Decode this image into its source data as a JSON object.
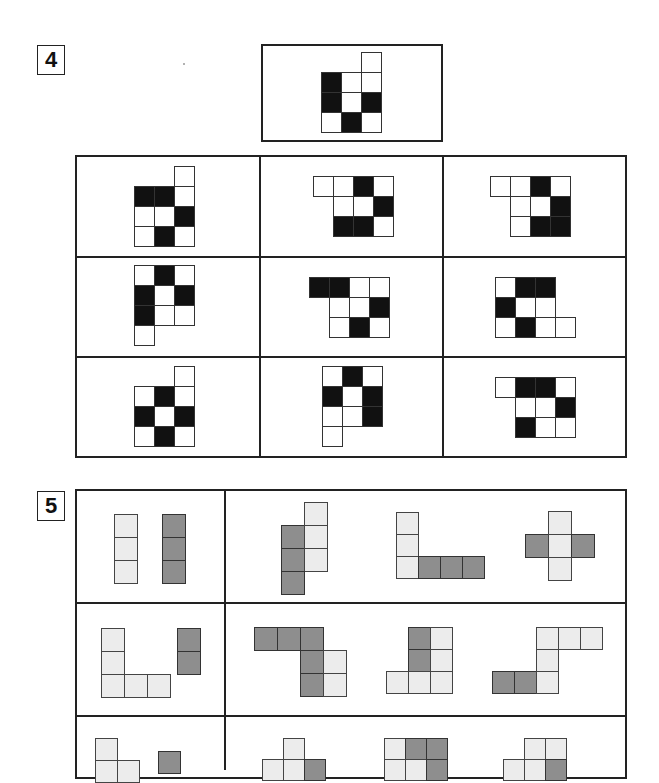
{
  "section4": {
    "label": "4",
    "reference": {
      "x": 321,
      "y": 52,
      "size": 20,
      "cells": [
        [
          2,
          0,
          "w"
        ],
        [
          0,
          1,
          "b"
        ],
        [
          1,
          1,
          "w"
        ],
        [
          2,
          1,
          "w"
        ],
        [
          0,
          2,
          "b"
        ],
        [
          1,
          2,
          "w"
        ],
        [
          2,
          2,
          "b"
        ],
        [
          0,
          3,
          "w"
        ],
        [
          1,
          3,
          "b"
        ],
        [
          2,
          3,
          "w"
        ]
      ]
    },
    "options": [
      {
        "x": 134,
        "y": 166,
        "size": 20,
        "cells": [
          [
            2,
            0,
            "w"
          ],
          [
            0,
            1,
            "b"
          ],
          [
            1,
            1,
            "b"
          ],
          [
            2,
            1,
            "w"
          ],
          [
            0,
            2,
            "w"
          ],
          [
            1,
            2,
            "w"
          ],
          [
            2,
            2,
            "b"
          ],
          [
            0,
            3,
            "w"
          ],
          [
            1,
            3,
            "b"
          ],
          [
            2,
            3,
            "w"
          ]
        ]
      },
      {
        "x": 313,
        "y": 176,
        "size": 20,
        "cells": [
          [
            0,
            0,
            "w"
          ],
          [
            1,
            0,
            "w"
          ],
          [
            2,
            0,
            "b"
          ],
          [
            3,
            0,
            "w"
          ],
          [
            1,
            1,
            "w"
          ],
          [
            2,
            1,
            "w"
          ],
          [
            3,
            1,
            "b"
          ],
          [
            1,
            2,
            "b"
          ],
          [
            2,
            2,
            "b"
          ],
          [
            3,
            2,
            "w"
          ]
        ]
      },
      {
        "x": 490,
        "y": 176,
        "size": 20,
        "cells": [
          [
            0,
            0,
            "w"
          ],
          [
            1,
            0,
            "w"
          ],
          [
            2,
            0,
            "b"
          ],
          [
            3,
            0,
            "w"
          ],
          [
            1,
            1,
            "w"
          ],
          [
            2,
            1,
            "w"
          ],
          [
            3,
            1,
            "b"
          ],
          [
            1,
            2,
            "w"
          ],
          [
            2,
            2,
            "b"
          ],
          [
            3,
            2,
            "b"
          ]
        ]
      },
      {
        "x": 134,
        "y": 265,
        "size": 20,
        "cells": [
          [
            0,
            0,
            "w"
          ],
          [
            1,
            0,
            "b"
          ],
          [
            2,
            0,
            "w"
          ],
          [
            0,
            1,
            "b"
          ],
          [
            1,
            1,
            "w"
          ],
          [
            2,
            1,
            "b"
          ],
          [
            0,
            2,
            "b"
          ],
          [
            1,
            2,
            "w"
          ],
          [
            2,
            2,
            "w"
          ],
          [
            0,
            3,
            "w"
          ]
        ]
      },
      {
        "x": 309,
        "y": 277,
        "size": 20,
        "cells": [
          [
            0,
            0,
            "b"
          ],
          [
            1,
            0,
            "b"
          ],
          [
            2,
            0,
            "w"
          ],
          [
            3,
            0,
            "w"
          ],
          [
            1,
            1,
            "w"
          ],
          [
            2,
            1,
            "w"
          ],
          [
            3,
            1,
            "b"
          ],
          [
            1,
            2,
            "w"
          ],
          [
            2,
            2,
            "b"
          ],
          [
            3,
            2,
            "w"
          ]
        ]
      },
      {
        "x": 495,
        "y": 277,
        "size": 20,
        "cells": [
          [
            0,
            0,
            "w"
          ],
          [
            1,
            0,
            "b"
          ],
          [
            2,
            0,
            "b"
          ],
          [
            0,
            1,
            "b"
          ],
          [
            1,
            1,
            "w"
          ],
          [
            2,
            1,
            "w"
          ],
          [
            0,
            2,
            "w"
          ],
          [
            1,
            2,
            "b"
          ],
          [
            2,
            2,
            "w"
          ],
          [
            3,
            2,
            "w"
          ]
        ]
      },
      {
        "x": 134,
        "y": 366,
        "size": 20,
        "cells": [
          [
            2,
            0,
            "w"
          ],
          [
            0,
            1,
            "w"
          ],
          [
            1,
            1,
            "b"
          ],
          [
            2,
            1,
            "w"
          ],
          [
            0,
            2,
            "b"
          ],
          [
            1,
            2,
            "w"
          ],
          [
            2,
            2,
            "b"
          ],
          [
            0,
            3,
            "w"
          ],
          [
            1,
            3,
            "b"
          ],
          [
            2,
            3,
            "w"
          ]
        ]
      },
      {
        "x": 322,
        "y": 366,
        "size": 20,
        "cells": [
          [
            0,
            0,
            "w"
          ],
          [
            1,
            0,
            "b"
          ],
          [
            2,
            0,
            "w"
          ],
          [
            0,
            1,
            "b"
          ],
          [
            1,
            1,
            "w"
          ],
          [
            2,
            1,
            "b"
          ],
          [
            0,
            2,
            "w"
          ],
          [
            1,
            2,
            "w"
          ],
          [
            2,
            2,
            "b"
          ],
          [
            0,
            3,
            "w"
          ]
        ]
      },
      {
        "x": 495,
        "y": 377,
        "size": 20,
        "cells": [
          [
            0,
            0,
            "w"
          ],
          [
            1,
            0,
            "b"
          ],
          [
            2,
            0,
            "b"
          ],
          [
            3,
            0,
            "w"
          ],
          [
            1,
            1,
            "w"
          ],
          [
            2,
            1,
            "w"
          ],
          [
            3,
            1,
            "b"
          ],
          [
            1,
            2,
            "b"
          ],
          [
            2,
            2,
            "w"
          ],
          [
            3,
            2,
            "w"
          ]
        ]
      }
    ]
  },
  "section5": {
    "label": "5",
    "rows": [
      {
        "left": [
          {
            "x": 114,
            "y": 514,
            "size": 23,
            "cells": [
              [
                0,
                0,
                "l"
              ],
              [
                0,
                1,
                "l"
              ],
              [
                0,
                2,
                "l"
              ]
            ]
          },
          {
            "x": 162,
            "y": 514,
            "size": 23,
            "cells": [
              [
                0,
                0,
                "g"
              ],
              [
                0,
                1,
                "g"
              ],
              [
                0,
                2,
                "g"
              ]
            ]
          }
        ],
        "right": [
          {
            "x": 281,
            "y": 502,
            "size": 23,
            "cells": [
              [
                1,
                0,
                "l"
              ],
              [
                0,
                1,
                "g"
              ],
              [
                1,
                1,
                "l"
              ],
              [
                0,
                2,
                "g"
              ],
              [
                1,
                2,
                "l"
              ],
              [
                0,
                3,
                "g"
              ]
            ]
          },
          {
            "x": 396,
            "y": 512,
            "size": 22,
            "cells": [
              [
                0,
                0,
                "l"
              ],
              [
                0,
                1,
                "l"
              ],
              [
                0,
                2,
                "l"
              ],
              [
                1,
                2,
                "g"
              ],
              [
                2,
                2,
                "g"
              ],
              [
                3,
                2,
                "g"
              ]
            ]
          },
          {
            "x": 525,
            "y": 511,
            "size": 23,
            "cells": [
              [
                1,
                0,
                "l"
              ],
              [
                0,
                1,
                "g"
              ],
              [
                1,
                1,
                "l"
              ],
              [
                2,
                1,
                "g"
              ],
              [
                1,
                2,
                "l"
              ]
            ]
          }
        ]
      },
      {
        "left": [
          {
            "x": 101,
            "y": 628,
            "size": 23,
            "cells": [
              [
                0,
                0,
                "l"
              ],
              [
                0,
                1,
                "l"
              ],
              [
                0,
                2,
                "l"
              ],
              [
                1,
                2,
                "l"
              ],
              [
                2,
                2,
                "l"
              ]
            ]
          },
          {
            "x": 177,
            "y": 628,
            "size": 23,
            "cells": [
              [
                0,
                0,
                "g"
              ],
              [
                0,
                1,
                "g"
              ]
            ]
          }
        ],
        "right": [
          {
            "x": 254,
            "y": 627,
            "size": 23,
            "cells": [
              [
                0,
                0,
                "g"
              ],
              [
                1,
                0,
                "g"
              ],
              [
                2,
                0,
                "g"
              ],
              [
                2,
                1,
                "g"
              ],
              [
                3,
                1,
                "l"
              ],
              [
                2,
                2,
                "g"
              ],
              [
                3,
                2,
                "l"
              ]
            ]
          },
          {
            "x": 386,
            "y": 627,
            "size": 22,
            "cells": [
              [
                1,
                0,
                "g"
              ],
              [
                2,
                0,
                "l"
              ],
              [
                1,
                1,
                "g"
              ],
              [
                2,
                1,
                "l"
              ],
              [
                0,
                2,
                "l"
              ],
              [
                1,
                2,
                "l"
              ],
              [
                2,
                2,
                "l"
              ]
            ]
          },
          {
            "x": 492,
            "y": 627,
            "size": 22,
            "cells": [
              [
                2,
                0,
                "l"
              ],
              [
                3,
                0,
                "l"
              ],
              [
                4,
                0,
                "l"
              ],
              [
                2,
                1,
                "l"
              ],
              [
                0,
                2,
                "g"
              ],
              [
                1,
                2,
                "g"
              ],
              [
                2,
                2,
                "l"
              ]
            ]
          }
        ]
      },
      {
        "left": [
          {
            "x": 95,
            "y": 738,
            "size": 22,
            "cells": [
              [
                0,
                0,
                "l"
              ],
              [
                0,
                1,
                "l"
              ],
              [
                1,
                1,
                "l"
              ]
            ]
          },
          {
            "x": 158,
            "y": 751,
            "size": 22,
            "cells": [
              [
                0,
                0,
                "g"
              ]
            ]
          }
        ],
        "right": [
          {
            "x": 262,
            "y": 738,
            "size": 21,
            "cells": [
              [
                1,
                0,
                "l"
              ],
              [
                0,
                1,
                "l"
              ],
              [
                1,
                1,
                "l"
              ],
              [
                2,
                1,
                "g"
              ]
            ]
          },
          {
            "x": 384,
            "y": 738,
            "size": 21,
            "cells": [
              [
                0,
                0,
                "l"
              ],
              [
                1,
                0,
                "g"
              ],
              [
                2,
                0,
                "g"
              ],
              [
                0,
                1,
                "l"
              ],
              [
                1,
                1,
                "l"
              ],
              [
                2,
                1,
                "g"
              ]
            ]
          },
          {
            "x": 503,
            "y": 738,
            "size": 21,
            "cells": [
              [
                1,
                0,
                "l"
              ],
              [
                2,
                0,
                "l"
              ],
              [
                0,
                1,
                "l"
              ],
              [
                1,
                1,
                "l"
              ],
              [
                2,
                1,
                "g"
              ]
            ]
          }
        ]
      }
    ]
  }
}
